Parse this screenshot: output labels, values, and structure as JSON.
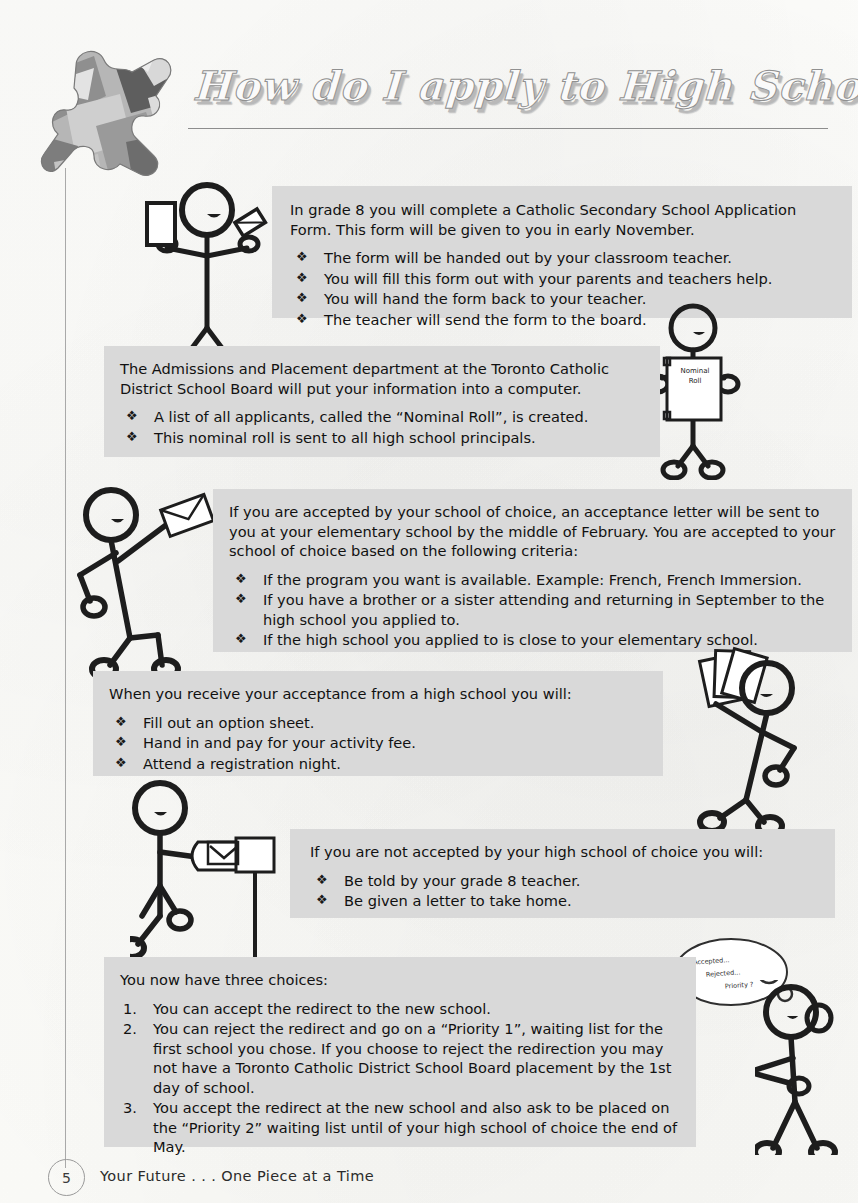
{
  "document": {
    "title": "How do I apply to High School?",
    "page_number": "5",
    "footer": "Your Future . . . One Piece at a Time",
    "logo_icon": "puzzle-piece-icon",
    "bullet_glyph": "❖"
  },
  "panels": [
    {
      "id": "panel-1",
      "intro": "In grade 8 you will complete a Catholic Secondary School Application Form. This form will be given to you in early November.",
      "list_type": "bullet",
      "items": [
        "The form will be handed out by your classroom teacher.",
        "You will fill this form out with your parents and teachers help.",
        "You will hand the form back to your teacher.",
        "The teacher will send the form to the board."
      ]
    },
    {
      "id": "panel-2",
      "intro": "The Admissions and Placement department at the Toronto Catholic District School Board will put your information into a computer.",
      "list_type": "bullet",
      "items": [
        "A list of all applicants, called the “Nominal Roll”, is created.",
        "This nominal roll is sent to all high school principals."
      ]
    },
    {
      "id": "panel-3",
      "intro": "If you are accepted by your school of choice, an acceptance letter will be sent to you at your elementary school by the middle of February. You are accepted to your school of choice based on the following criteria:",
      "list_type": "bullet",
      "items": [
        "If the program you want is available. Example:  French, French Immersion.",
        "If you have a brother or a sister attending and returning in September to the high school you applied to.",
        "If the high school you applied to is close to your elementary school."
      ]
    },
    {
      "id": "panel-4",
      "intro": "When you receive your acceptance from a high school you will:",
      "list_type": "bullet",
      "items": [
        "Fill out an option sheet.",
        "Hand in and pay for your activity fee.",
        "Attend a registration night."
      ]
    },
    {
      "id": "panel-5",
      "intro": "If you are not accepted by your high school of choice you will:",
      "list_type": "bullet",
      "items": [
        "Be told by your grade 8 teacher.",
        "Be given a letter to take home."
      ]
    },
    {
      "id": "panel-6",
      "intro": "You now have three choices:",
      "list_type": "number",
      "items": [
        "You can accept the redirect to the new school.",
        "You can reject the redirect and go on a “Priority 1”, waiting list for the first school you chose. If you choose to reject the redirection you may not have a Toronto Catholic District School Board placement by the 1st day of school.",
        "You accept the redirect at the new school and also ask to be placed on the “Priority 2” waiting list until of your high school of choice the end of May."
      ],
      "numbers": [
        "1.",
        "2.",
        "3."
      ]
    }
  ],
  "illustrations": {
    "figure_1": {
      "name": "stick-figure-holding-form-and-pen"
    },
    "figure_2": {
      "name": "stick-figure-holding-clipboard",
      "clipboard_label_line1": "Nominal",
      "clipboard_label_line2": "Roll"
    },
    "figure_3": {
      "name": "stick-figure-holding-letter"
    },
    "figure_4": {
      "name": "stick-figure-holding-papers"
    },
    "figure_5": {
      "name": "stick-figure-at-mailbox"
    },
    "figure_6": {
      "name": "stick-figure-thinking",
      "thought_line1": "Accepted...",
      "thought_line2": "Rejected...",
      "thought_line3": "Priority ?"
    }
  },
  "colors": {
    "panel_background": "#d9d9d9",
    "page_background": "#fdfdfb",
    "ink": "#111111",
    "rule": "#8d8d8d"
  }
}
